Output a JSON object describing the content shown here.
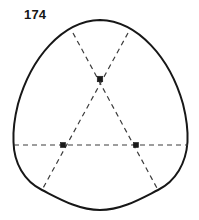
{
  "figure": {
    "label": "174",
    "caption_position": "top-left",
    "colors": {
      "outline": "#171717",
      "dashed": "#3c3c3c",
      "vertex": "#1a1a1a",
      "background": "#ffffff",
      "label": "#161616"
    },
    "geometry": {
      "outline_points": [
        {
          "name": "top-apex",
          "x": 100,
          "y": 20
        },
        {
          "name": "left-extreme",
          "x": 13,
          "y": 142
        },
        {
          "name": "right-extreme",
          "x": 188,
          "y": 142
        },
        {
          "name": "bottom-left-corner",
          "x": 42,
          "y": 190
        },
        {
          "name": "bottom-right-corner",
          "x": 158,
          "y": 190
        },
        {
          "name": "bottom-apex",
          "x": 100,
          "y": 210
        }
      ],
      "vertices": [
        {
          "name": "upper-vertex",
          "x": 100,
          "y": 79
        },
        {
          "name": "lower-left-vertex",
          "x": 63,
          "y": 145
        },
        {
          "name": "lower-right-vertex",
          "x": 136,
          "y": 145
        }
      ],
      "dashed_lines": [
        {
          "name": "horizontal-axis",
          "x1": 14,
          "y1": 145,
          "x2": 188,
          "y2": 145
        },
        {
          "name": "left-diagonal",
          "x1": 73,
          "y1": 33,
          "x2": 158,
          "y2": 190
        },
        {
          "name": "right-diagonal",
          "x1": 128,
          "y1": 33,
          "x2": 42,
          "y2": 190
        }
      ],
      "dash_pattern": "5,4",
      "outline_stroke_width": 2,
      "dashed_stroke_width": 1.2
    }
  }
}
